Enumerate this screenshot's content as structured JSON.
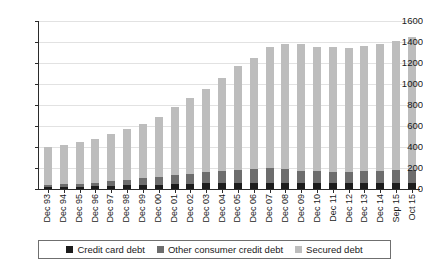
{
  "chart_data": {
    "type": "bar",
    "stacked": true,
    "title": "",
    "xlabel": "",
    "ylabel": "",
    "ylim": [
      0,
      1600
    ],
    "ytick_step": 200,
    "yticks": [
      1600,
      1400,
      1200,
      1000,
      800,
      600,
      400,
      200,
      0
    ],
    "grid": true,
    "legend_position": "bottom",
    "categories": [
      "Dec 93",
      "Dec 94",
      "Dec 95",
      "Dec 96",
      "Dec 97",
      "Dec 98",
      "Dec 99",
      "Dec 00",
      "Dec 01",
      "Dec 02",
      "Dec 03",
      "Dec 04",
      "Dec 05",
      "Dec 06",
      "Dec 07",
      "Dec 08",
      "Dec 09",
      "Dec 10",
      "Dec 11",
      "Dec 12",
      "Dec 13",
      "Dec 14",
      "Sep 15",
      "Oct 15"
    ],
    "series": [
      {
        "name": "Credit card debt",
        "color": "#1c1c1c",
        "values": [
          18,
          20,
          23,
          27,
          31,
          35,
          39,
          43,
          47,
          50,
          54,
          56,
          57,
          58,
          60,
          58,
          56,
          55,
          55,
          56,
          57,
          58,
          60,
          61
        ]
      },
      {
        "name": "Other consumer credit debt",
        "color": "#6d6d6d",
        "values": [
          22,
          25,
          29,
          35,
          42,
          50,
          62,
          72,
          83,
          96,
          108,
          118,
          125,
          130,
          138,
          128,
          120,
          114,
          110,
          108,
          110,
          114,
          118,
          120
        ]
      },
      {
        "name": "Secured debt",
        "color": "#bdbdbd",
        "values": [
          360,
          375,
          398,
          418,
          447,
          485,
          519,
          575,
          650,
          724,
          795,
          886,
          988,
          1062,
          1152,
          1194,
          1204,
          1181,
          1185,
          1176,
          1193,
          1208,
          1232,
          1269
        ]
      }
    ],
    "totals": [
      400,
      420,
      450,
      480,
      520,
      570,
      620,
      690,
      780,
      870,
      957,
      1060,
      1170,
      1250,
      1350,
      1380,
      1380,
      1350,
      1350,
      1340,
      1360,
      1380,
      1410,
      1450
    ]
  },
  "legend": {
    "items": [
      {
        "label": "Credit card debt",
        "color": "#1c1c1c"
      },
      {
        "label": "Other consumer credit debt",
        "color": "#6d6d6d"
      },
      {
        "label": "Secured debt",
        "color": "#bdbdbd"
      }
    ]
  }
}
